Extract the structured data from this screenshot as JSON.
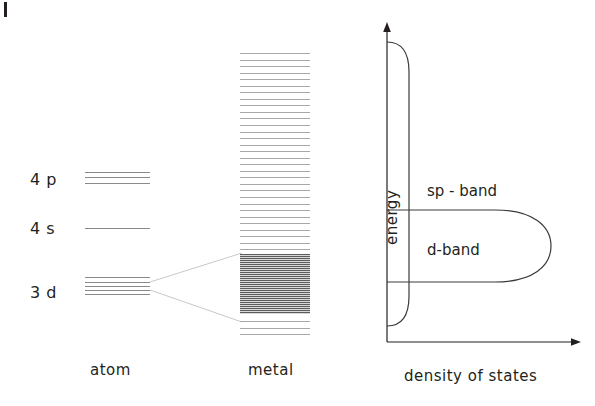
{
  "figure": {
    "title_none": "",
    "atom": {
      "caption": "atom",
      "levels": [
        {
          "name": "4p",
          "label": "4 p",
          "line_count": 3
        },
        {
          "name": "4s",
          "label": "4 s",
          "line_count": 1
        },
        {
          "name": "3d",
          "label": "3 d",
          "line_count": 5
        }
      ]
    },
    "metal": {
      "caption": "metal",
      "line_count": 44,
      "dense_band_name": "d-band-dense-region"
    },
    "dos": {
      "x_axis_label": "density of states",
      "y_axis_label": "energy",
      "curves": [
        {
          "name": "sp-band",
          "label": "sp - band"
        },
        {
          "name": "d-band",
          "label": "d-band"
        }
      ]
    }
  },
  "colors": {
    "ink": "#231f20",
    "level_line": "#8a8a8a",
    "metal_line": "#a8a8a8",
    "dense_dark": "#5c5c5c",
    "curve": "#3a3a3a",
    "fan": "#c9c9c9"
  },
  "chart_data": {
    "type": "line",
    "title": "",
    "xlabel": "density of states",
    "ylabel": "energy",
    "grid": false,
    "legend": "none",
    "annotations": [
      "sp - band",
      "d-band",
      "atom",
      "metal",
      "4 p",
      "4 s",
      "3 d"
    ],
    "series": [
      {
        "name": "sp - band",
        "description": "narrow tall band of nearly constant low density spanning most of the energy range",
        "energy_range": [
          0.07,
          0.93
        ],
        "dos_peak": 0.12
      },
      {
        "name": "d-band",
        "description": "broad lobe of high density of states at lower energy",
        "energy_range": [
          0.12,
          0.42
        ],
        "dos_peak": 1.0
      }
    ]
  }
}
